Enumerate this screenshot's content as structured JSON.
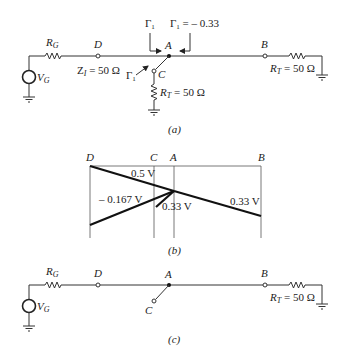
{
  "figure_a": {
    "caption": "(a)",
    "labels": {
      "rg": "R",
      "rg_sub": "G",
      "vg": "V",
      "vg_sub": "G",
      "node_d": "D",
      "node_a": "A",
      "node_b": "B",
      "node_c": "C",
      "zi": "Z",
      "zi_sub": "I",
      "zi_value": " = 50 Ω",
      "gamma_left": "Γ",
      "gamma_left_sub": "1",
      "gamma_right": "Γ",
      "gamma_right_sub": "1",
      "gamma_right_value": " = – 0.33",
      "gamma_stub": "Γ",
      "gamma_stub_sub": "1",
      "rt_stub": "R",
      "rt_stub_sub": "T",
      "rt_stub_value": " = 50 Ω",
      "rt_end": "R",
      "rt_end_sub": "T",
      "rt_end_value": " = 50 Ω"
    }
  },
  "figure_b": {
    "caption": "(b)",
    "columns": [
      "D",
      "C",
      "A",
      "B"
    ],
    "voltages": {
      "incident": "0.5 V",
      "reflected": "– 0.167 V",
      "stub": "0.33 V",
      "transmitted": "0.33 V"
    }
  },
  "figure_c": {
    "caption": "(c)",
    "labels": {
      "rg": "R",
      "rg_sub": "G",
      "vg": "V",
      "vg_sub": "G",
      "node_d": "D",
      "node_a": "A",
      "node_b": "B",
      "node_c": "C",
      "rt_end": "R",
      "rt_end_sub": "T",
      "rt_end_value": " = 50 Ω"
    }
  }
}
